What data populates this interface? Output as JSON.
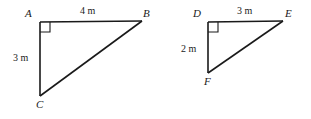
{
  "figure": {
    "background_color": "#ffffff",
    "stroke_color": "#1a1a1a",
    "width": 311,
    "height": 119
  },
  "triangles": [
    {
      "name": "triangle-abc",
      "vertices": [
        {
          "label": "A",
          "x": 40,
          "y": 22,
          "label_x": 25,
          "label_y": 8
        },
        {
          "label": "B",
          "x": 142,
          "y": 21,
          "label_x": 143,
          "label_y": 8
        },
        {
          "label": "C",
          "x": 40,
          "y": 96,
          "label_x": 36,
          "label_y": 99
        }
      ],
      "right_angle_at": "A",
      "sides": [
        {
          "name": "top-side",
          "label": "4 m",
          "label_x": 80,
          "label_y": 6
        },
        {
          "name": "left-side",
          "label": "3 m",
          "label_x": 13,
          "label_y": 53
        }
      ]
    },
    {
      "name": "triangle-def",
      "vertices": [
        {
          "label": "D",
          "x": 208,
          "y": 22,
          "label_x": 193,
          "label_y": 8
        },
        {
          "label": "E",
          "x": 283,
          "y": 21,
          "label_x": 285,
          "label_y": 8
        },
        {
          "label": "F",
          "x": 208,
          "y": 73,
          "label_x": 204,
          "label_y": 76
        }
      ],
      "right_angle_at": "D",
      "sides": [
        {
          "name": "top-side",
          "label": "3 m",
          "label_x": 237,
          "label_y": 6
        },
        {
          "name": "left-side",
          "label": "2 m",
          "label_x": 181,
          "label_y": 44
        }
      ]
    }
  ]
}
